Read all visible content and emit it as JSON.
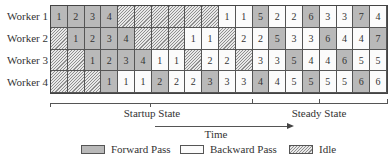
{
  "figure": {
    "workers": [
      {
        "label": "Worker 1",
        "cells": [
          {
            "t": "F",
            "v": "1"
          },
          {
            "t": "F",
            "v": "2"
          },
          {
            "t": "F",
            "v": "3"
          },
          {
            "t": "F",
            "v": "4"
          },
          {
            "t": "I",
            "v": ""
          },
          {
            "t": "I",
            "v": ""
          },
          {
            "t": "I",
            "v": ""
          },
          {
            "t": "I",
            "v": ""
          },
          {
            "t": "I",
            "v": ""
          },
          {
            "t": "I",
            "v": ""
          },
          {
            "t": "B",
            "v": "1"
          },
          {
            "t": "B",
            "v": "1"
          },
          {
            "t": "F",
            "v": "5"
          },
          {
            "t": "B",
            "v": "2"
          },
          {
            "t": "B",
            "v": "2"
          },
          {
            "t": "F",
            "v": "6"
          },
          {
            "t": "B",
            "v": "3"
          },
          {
            "t": "B",
            "v": "3"
          },
          {
            "t": "F",
            "v": "7"
          },
          {
            "t": "B",
            "v": "4"
          }
        ]
      },
      {
        "label": "Worker 2",
        "cells": [
          {
            "t": "I",
            "v": ""
          },
          {
            "t": "F",
            "v": "1"
          },
          {
            "t": "F",
            "v": "2"
          },
          {
            "t": "F",
            "v": "3"
          },
          {
            "t": "F",
            "v": "4"
          },
          {
            "t": "I",
            "v": ""
          },
          {
            "t": "I",
            "v": ""
          },
          {
            "t": "I",
            "v": ""
          },
          {
            "t": "B",
            "v": "1"
          },
          {
            "t": "B",
            "v": "1"
          },
          {
            "t": "I",
            "v": ""
          },
          {
            "t": "B",
            "v": "2"
          },
          {
            "t": "B",
            "v": "2"
          },
          {
            "t": "F",
            "v": "5"
          },
          {
            "t": "B",
            "v": "3"
          },
          {
            "t": "B",
            "v": "3"
          },
          {
            "t": "F",
            "v": "6"
          },
          {
            "t": "B",
            "v": "4"
          },
          {
            "t": "B",
            "v": "4"
          },
          {
            "t": "F",
            "v": "7"
          }
        ]
      },
      {
        "label": "Worker 3",
        "cells": [
          {
            "t": "I",
            "v": ""
          },
          {
            "t": "I",
            "v": ""
          },
          {
            "t": "F",
            "v": "1"
          },
          {
            "t": "F",
            "v": "2"
          },
          {
            "t": "F",
            "v": "3"
          },
          {
            "t": "F",
            "v": "4"
          },
          {
            "t": "B",
            "v": "1"
          },
          {
            "t": "B",
            "v": "1"
          },
          {
            "t": "I",
            "v": ""
          },
          {
            "t": "B",
            "v": "2"
          },
          {
            "t": "B",
            "v": "2"
          },
          {
            "t": "I",
            "v": ""
          },
          {
            "t": "B",
            "v": "3"
          },
          {
            "t": "B",
            "v": "3"
          },
          {
            "t": "F",
            "v": "5"
          },
          {
            "t": "B",
            "v": "4"
          },
          {
            "t": "B",
            "v": "4"
          },
          {
            "t": "F",
            "v": "6"
          },
          {
            "t": "B",
            "v": "5"
          },
          {
            "t": "B",
            "v": "5"
          }
        ]
      },
      {
        "label": "Worker 4",
        "cells": [
          {
            "t": "I",
            "v": ""
          },
          {
            "t": "I",
            "v": ""
          },
          {
            "t": "I",
            "v": ""
          },
          {
            "t": "F",
            "v": "1"
          },
          {
            "t": "B",
            "v": "1"
          },
          {
            "t": "B",
            "v": "1"
          },
          {
            "t": "F",
            "v": "2"
          },
          {
            "t": "B",
            "v": "2"
          },
          {
            "t": "B",
            "v": "2"
          },
          {
            "t": "F",
            "v": "3"
          },
          {
            "t": "B",
            "v": "3"
          },
          {
            "t": "B",
            "v": "3"
          },
          {
            "t": "F",
            "v": "4"
          },
          {
            "t": "B",
            "v": "4"
          },
          {
            "t": "B",
            "v": "5"
          },
          {
            "t": "F",
            "v": "5"
          },
          {
            "t": "B",
            "v": "5"
          },
          {
            "t": "B",
            "v": "5"
          },
          {
            "t": "F",
            "v": "6"
          },
          {
            "t": "B",
            "v": "6"
          }
        ]
      }
    ],
    "phases": {
      "startup": "Startup State",
      "steady": "Steady State"
    },
    "axis_label": "Time",
    "legend": {
      "forward": "Forward Pass",
      "backward": "Backward Pass",
      "idle": "Idle"
    },
    "colors": {
      "forward": "#b9b9b9",
      "backward": "#fbfbfb",
      "idle_hatch": "#8e8e8e"
    }
  }
}
